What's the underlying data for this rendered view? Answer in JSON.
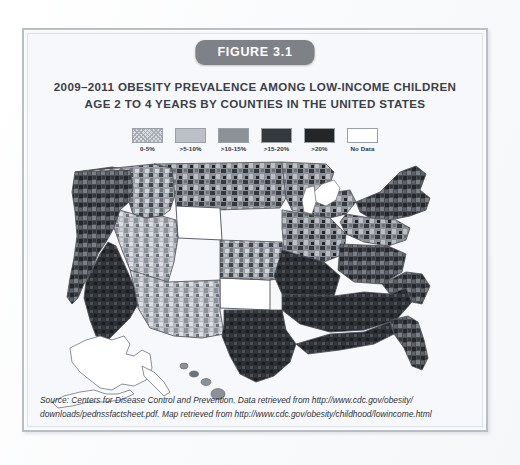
{
  "figure": {
    "badge_label": "FIGURE 3.1",
    "title_line_1": "2009–2011 OBESITY PREVALENCE AMONG LOW-INCOME CHILDREN",
    "title_line_2": "AGE 2 TO 4 YEARS BY COUNTIES IN THE UNITED STATES"
  },
  "legend": {
    "items": [
      {
        "label": "0-5%",
        "color": "#d8dade",
        "pattern": "stipple"
      },
      {
        "label": ">5-10%",
        "color": "#bcc0c6",
        "pattern": "solid"
      },
      {
        "label": ">10-15%",
        "color": "#8c9198",
        "pattern": "solid"
      },
      {
        "label": ">15-20%",
        "color": "#35383d",
        "pattern": "solid"
      },
      {
        "label": ">20%",
        "color": "#24262a",
        "pattern": "solid"
      },
      {
        "label": "No Data",
        "color": "#ffffff",
        "pattern": "solid"
      }
    ]
  },
  "map": {
    "type": "choropleth",
    "geography": "United States counties",
    "insets": [
      "Alaska",
      "Hawaii"
    ],
    "no_data_states": [
      "Colorado",
      "Wyoming",
      "Alaska"
    ],
    "water_color": "#ffffff",
    "outline_color": "#4a4e55"
  },
  "source": {
    "line_1": "Source: Centers for Disease Control and Prevention. Data retrieved from http://www.cdc.gov/obesity/",
    "line_2": "downloads/pednssfactsheet.pdf. Map retrieved from http://www.cdc.gov/obesity/childhood/lowincome.html"
  },
  "colors": {
    "frame_border": "#b9bec6",
    "frame_background": "#f7f8fb",
    "badge_background": "#7e8287",
    "badge_text": "#ffffff",
    "title_text": "#3b4048",
    "page_background": "#fdfdfe"
  }
}
